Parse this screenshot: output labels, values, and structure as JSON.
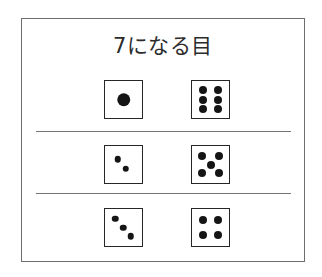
{
  "figure": {
    "title": "7になる目",
    "background_color": "#ffffff",
    "frame_color": "#6e6e6e",
    "pip_color": "#151515",
    "die_border_color": "#262626"
  },
  "chart_data": {
    "type": "table",
    "title": "7になる目",
    "xlabel": "",
    "ylabel": "",
    "categories": [
      "1 + 6",
      "2 + 5",
      "3 + 4"
    ],
    "values": [
      7,
      7,
      7
    ],
    "series": [
      {
        "name": "left die",
        "values": [
          1,
          2,
          3
        ]
      },
      {
        "name": "right die",
        "values": [
          6,
          5,
          4
        ]
      }
    ],
    "rows": [
      {
        "left": {
          "face": 1,
          "pips": [
            {
              "x": 50,
              "y": 50,
              "size": "lg"
            }
          ]
        },
        "right": {
          "face": 6,
          "pips": [
            {
              "x": 31,
              "y": 24,
              "size": "md"
            },
            {
              "x": 69,
              "y": 24,
              "size": "md"
            },
            {
              "x": 31,
              "y": 50,
              "size": "md"
            },
            {
              "x": 69,
              "y": 50,
              "size": "md"
            },
            {
              "x": 31,
              "y": 76,
              "size": "md"
            },
            {
              "x": 69,
              "y": 76,
              "size": "md"
            }
          ]
        },
        "sum": 7
      },
      {
        "left": {
          "face": 2,
          "pips": [
            {
              "x": 35,
              "y": 36,
              "size": "sm"
            },
            {
              "x": 56,
              "y": 62,
              "size": "sm"
            }
          ]
        },
        "right": {
          "face": 5,
          "pips": [
            {
              "x": 28,
              "y": 27,
              "size": "md"
            },
            {
              "x": 72,
              "y": 27,
              "size": "md"
            },
            {
              "x": 50,
              "y": 50,
              "size": "md"
            },
            {
              "x": 28,
              "y": 73,
              "size": "md"
            },
            {
              "x": 72,
              "y": 73,
              "size": "md"
            }
          ]
        },
        "sum": 7
      },
      {
        "left": {
          "face": 3,
          "pips": [
            {
              "x": 28,
              "y": 26,
              "size": "sm"
            },
            {
              "x": 49,
              "y": 50,
              "size": "sm"
            },
            {
              "x": 70,
              "y": 74,
              "size": "sm"
            }
          ]
        },
        "right": {
          "face": 4,
          "pips": [
            {
              "x": 30,
              "y": 30,
              "size": "md"
            },
            {
              "x": 70,
              "y": 30,
              "size": "md"
            },
            {
              "x": 30,
              "y": 70,
              "size": "md"
            },
            {
              "x": 70,
              "y": 70,
              "size": "md"
            }
          ]
        },
        "sum": 7
      }
    ],
    "grid": false,
    "legend": false
  }
}
